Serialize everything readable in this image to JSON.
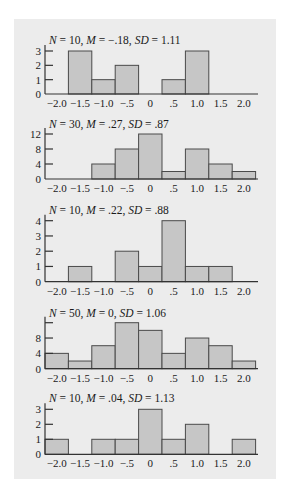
{
  "figure": {
    "width": 290,
    "height": 498,
    "panel": {
      "x": 14,
      "y": 19,
      "w": 262,
      "h": 460
    },
    "colors": {
      "panel_bg": "#ececec",
      "bar_fill": "#c6c6c6",
      "bar_stroke": "#4a4a4a",
      "axis": "#333333",
      "text": "#1a1a1a"
    }
  },
  "chart_data": [
    {
      "type": "bar",
      "title": "N = 10, M = −.18, SD = 1.11",
      "stats": {
        "N": "10",
        "M": "−.18",
        "SD": "1.11"
      },
      "categories": [
        -2.0,
        -1.5,
        -1.0,
        -0.5,
        0,
        0.5,
        1.0,
        1.5,
        2.0
      ],
      "x_tick_labels": [
        "−2.0",
        "−1.5",
        "−1.0",
        "−.5",
        "0",
        ".5",
        "1.0",
        "1.5",
        "2.0"
      ],
      "values": [
        0,
        3,
        1,
        2,
        0,
        1,
        3,
        0,
        0
      ],
      "y_ticks": [
        0,
        1,
        2,
        3
      ],
      "y_tick_labels": [
        "0",
        "1",
        "2",
        "3"
      ],
      "ylim": [
        0,
        3
      ],
      "xlabel": "",
      "ylabel": "",
      "grid": false,
      "legend": null
    },
    {
      "type": "bar",
      "title": "N = 30, M = .27, SD = .87",
      "stats": {
        "N": "30",
        "M": ".27",
        "SD": ".87"
      },
      "categories": [
        -2.0,
        -1.5,
        -1.0,
        -0.5,
        0,
        0.5,
        1.0,
        1.5,
        2.0
      ],
      "x_tick_labels": [
        "−2.0",
        "−1.5",
        "−1.0",
        "−.5",
        "0",
        ".5",
        "1.0",
        "1.5",
        "2.0"
      ],
      "values": [
        0,
        0,
        4,
        8,
        12,
        2,
        8,
        4,
        2
      ],
      "y_ticks": [
        0,
        4,
        8,
        12
      ],
      "y_tick_labels": [
        "0",
        "4",
        "8",
        "12"
      ],
      "ylim": [
        0,
        12
      ],
      "xlabel": "",
      "ylabel": "",
      "grid": false,
      "legend": null
    },
    {
      "type": "bar",
      "title": "N = 10, M = .22, SD = .88",
      "stats": {
        "N": "10",
        "M": ".22",
        "SD": ".88"
      },
      "categories": [
        -2.0,
        -1.5,
        -1.0,
        -0.5,
        0,
        0.5,
        1.0,
        1.5,
        2.0
      ],
      "x_tick_labels": [
        "−2.0",
        "−1.5",
        "−1.0",
        "−.5",
        "0",
        ".5",
        "1.0",
        "1.5",
        "2.0"
      ],
      "values": [
        0,
        1,
        0,
        2,
        1,
        4,
        1,
        1,
        0
      ],
      "y_ticks": [
        0,
        1,
        2,
        3,
        4
      ],
      "y_tick_labels": [
        "0",
        "1",
        "2",
        "3",
        "4"
      ],
      "ylim": [
        0,
        4
      ],
      "xlabel": "",
      "ylabel": "",
      "grid": false,
      "legend": null
    },
    {
      "type": "bar",
      "title": "N = 50, M = 0, SD = 1.06",
      "stats": {
        "N": "50",
        "M": "0",
        "SD": "1.06"
      },
      "categories": [
        -2.0,
        -1.5,
        -1.0,
        -0.5,
        0,
        0.5,
        1.0,
        1.5,
        2.0
      ],
      "x_tick_labels": [
        "−2.0",
        "−1.5",
        "−1.0",
        "−.5",
        "0",
        ".5",
        "1.0",
        "1.5",
        "2.0"
      ],
      "values": [
        4,
        2,
        6,
        12,
        10,
        4,
        8,
        6,
        2
      ],
      "y_ticks": [
        0,
        4,
        8,
        12
      ],
      "y_tick_labels": [
        "0",
        "4",
        "8",
        ""
      ],
      "ylim": [
        0,
        12
      ],
      "xlabel": "",
      "ylabel": "",
      "grid": false,
      "legend": null
    },
    {
      "type": "bar",
      "title": "N = 10, M = .04, SD = 1.13",
      "stats": {
        "N": "10",
        "M": ".04",
        "SD": "1.13"
      },
      "categories": [
        -2.0,
        -1.5,
        -1.0,
        -0.5,
        0,
        0.5,
        1.0,
        1.5,
        2.0
      ],
      "x_tick_labels": [
        "−2.0",
        "−1.5",
        "−1.0",
        "−.5",
        "0",
        ".5",
        "1.0",
        "1.5",
        "2.0"
      ],
      "values": [
        1,
        0,
        1,
        1,
        3,
        1,
        2,
        0,
        1
      ],
      "y_ticks": [
        0,
        1,
        2,
        3
      ],
      "y_tick_labels": [
        "0",
        "1",
        "2",
        "3"
      ],
      "ylim": [
        0,
        3
      ],
      "xlabel": "",
      "ylabel": "",
      "grid": false,
      "legend": null
    }
  ],
  "layout": {
    "x_axis_px": {
      "origin": 45,
      "px_per_unit": 46.8,
      "min": -2.25,
      "end_px": 258
    },
    "charts_px": [
      {
        "baseline": 94,
        "top_tick_y": 51,
        "title_y": 44
      },
      {
        "baseline": 179,
        "top_tick_y": 134,
        "title_y": 128
      },
      {
        "baseline": 281.7,
        "top_tick_y": 220.7,
        "title_y": 214
      },
      {
        "baseline": 368.7,
        "top_tick_y": 322.7,
        "title_y": 317
      },
      {
        "baseline": 454.3,
        "top_tick_y": 409.3,
        "title_y": 402
      }
    ]
  }
}
